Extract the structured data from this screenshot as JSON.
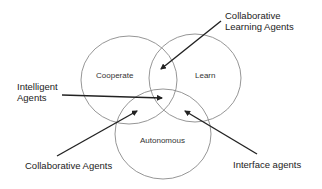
{
  "diagram": {
    "type": "venn",
    "sets": [
      {
        "id": "cooperate",
        "label": "Cooperate"
      },
      {
        "id": "learn",
        "label": "Learn"
      },
      {
        "id": "autonomous",
        "label": "Autonomous"
      }
    ],
    "annotations": [
      {
        "id": "collab-learning",
        "line1": "Collaborative",
        "line2": "Learning Agents",
        "points_to": [
          "cooperate",
          "learn"
        ]
      },
      {
        "id": "intelligent",
        "line1": "Intelligent",
        "line2": "Agents",
        "points_to": [
          "cooperate",
          "learn",
          "autonomous"
        ]
      },
      {
        "id": "collaborative",
        "label": "Collaborative Agents",
        "points_to": [
          "cooperate",
          "autonomous"
        ]
      },
      {
        "id": "interface",
        "label": "Interface agents",
        "points_to": [
          "learn",
          "autonomous"
        ]
      }
    ],
    "colors": {
      "stroke": "#888888",
      "arrow": "#222222",
      "text": "#222222"
    }
  }
}
